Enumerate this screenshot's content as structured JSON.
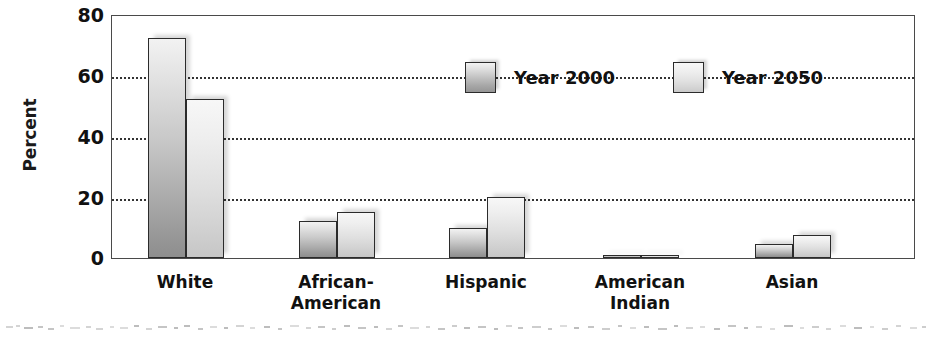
{
  "chart_data": {
    "type": "bar",
    "title": "",
    "xlabel": "",
    "ylabel": "Percent",
    "ylim": [
      0,
      80
    ],
    "yticks": [
      0,
      20,
      40,
      60,
      80
    ],
    "grid": "horizontal-dotted",
    "legend_position": "inside-top-center",
    "categories": [
      "White",
      "African-American",
      "Hispanic",
      "American Indian",
      "Asian"
    ],
    "category_lines": [
      [
        "White"
      ],
      [
        "African-",
        "American"
      ],
      [
        "Hispanic"
      ],
      [
        "American",
        "Indian"
      ],
      [
        "Asian"
      ]
    ],
    "series": [
      {
        "name": "Year 2000",
        "color": "#a8a8a8",
        "values": [
          72,
          12,
          10,
          1,
          4.5
        ]
      },
      {
        "name": "Year 2050",
        "color": "#dcdcdc",
        "values": [
          52,
          15,
          20,
          1,
          7.5
        ]
      }
    ]
  },
  "axis": {
    "y_title": "Percent",
    "y_tick_labels": [
      "80",
      "60",
      "40",
      "20",
      "0"
    ]
  },
  "legend": {
    "items": [
      {
        "label": "Year 2000"
      },
      {
        "label": "Year 2050"
      }
    ]
  }
}
